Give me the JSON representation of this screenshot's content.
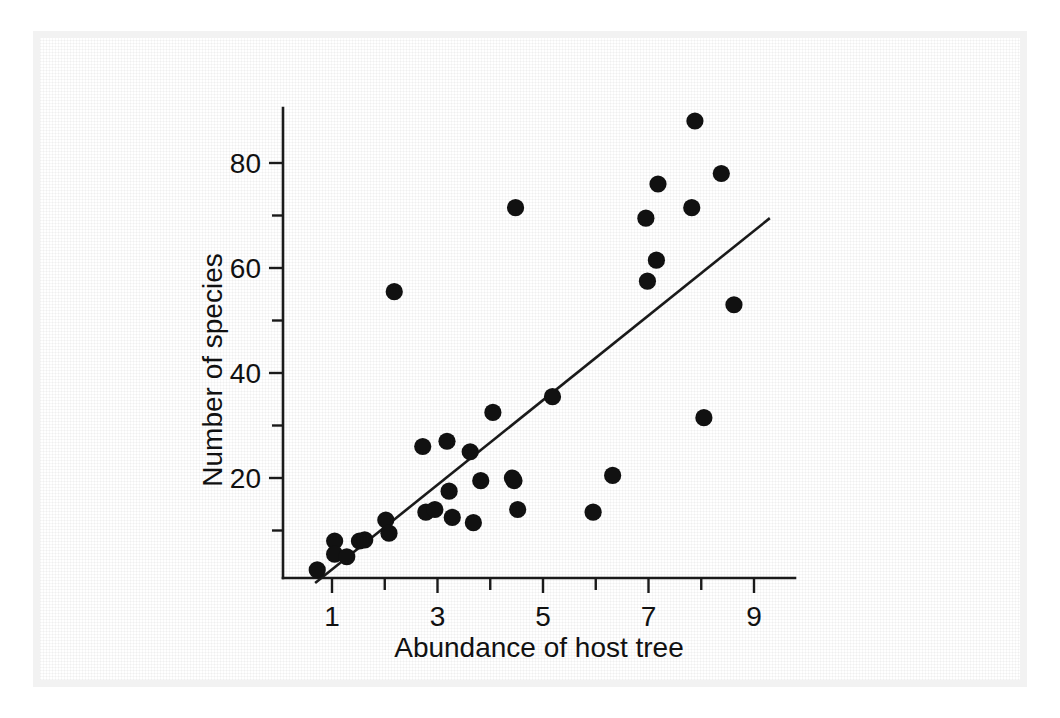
{
  "chart_data": {
    "type": "scatter",
    "title": "",
    "xlabel": "Abundance of host tree",
    "ylabel": "Number of species",
    "xlim": [
      0.55,
      9.8
    ],
    "ylim": [
      0,
      91
    ],
    "grid": false,
    "legend": "none",
    "point_color": "#111111",
    "line_color": "#1a1a1a",
    "xticks_major": [
      1,
      3,
      5,
      7,
      9
    ],
    "xticks_minor": [
      2,
      4,
      6,
      8
    ],
    "yticks_major": [
      20,
      40,
      60,
      80
    ],
    "yticks_minor": [
      10,
      30,
      50,
      70
    ],
    "xtick_labels": [
      "1",
      "3",
      "5",
      "7",
      "9"
    ],
    "ytick_labels": [
      "20",
      "40",
      "60",
      "80"
    ],
    "points": [
      {
        "x": 0.72,
        "y": 2.5
      },
      {
        "x": 1.05,
        "y": 8.0
      },
      {
        "x": 1.05,
        "y": 5.5
      },
      {
        "x": 1.28,
        "y": 5.0
      },
      {
        "x": 1.52,
        "y": 8.0
      },
      {
        "x": 1.62,
        "y": 8.2
      },
      {
        "x": 2.02,
        "y": 12.0
      },
      {
        "x": 2.08,
        "y": 9.5
      },
      {
        "x": 2.18,
        "y": 55.5
      },
      {
        "x": 2.72,
        "y": 26.0
      },
      {
        "x": 2.78,
        "y": 13.5
      },
      {
        "x": 2.95,
        "y": 14.0
      },
      {
        "x": 3.18,
        "y": 27.0
      },
      {
        "x": 3.22,
        "y": 17.5
      },
      {
        "x": 3.28,
        "y": 12.5
      },
      {
        "x": 3.62,
        "y": 25.0
      },
      {
        "x": 3.68,
        "y": 11.5
      },
      {
        "x": 3.82,
        "y": 19.5
      },
      {
        "x": 4.05,
        "y": 32.5
      },
      {
        "x": 4.48,
        "y": 71.5
      },
      {
        "x": 4.45,
        "y": 19.5
      },
      {
        "x": 4.42,
        "y": 20.0
      },
      {
        "x": 4.52,
        "y": 14.0
      },
      {
        "x": 5.18,
        "y": 35.5
      },
      {
        "x": 5.95,
        "y": 13.5
      },
      {
        "x": 6.32,
        "y": 20.5
      },
      {
        "x": 6.95,
        "y": 69.5
      },
      {
        "x": 6.98,
        "y": 57.5
      },
      {
        "x": 7.18,
        "y": 76.0
      },
      {
        "x": 7.15,
        "y": 61.5
      },
      {
        "x": 7.88,
        "y": 88.0
      },
      {
        "x": 7.82,
        "y": 71.5
      },
      {
        "x": 8.05,
        "y": 31.5
      },
      {
        "x": 8.38,
        "y": 78.0
      },
      {
        "x": 8.62,
        "y": 53.0
      }
    ],
    "fit_line": {
      "x1": 0.68,
      "y1": 0.0,
      "x2": 9.3,
      "y2": 69.5
    }
  }
}
